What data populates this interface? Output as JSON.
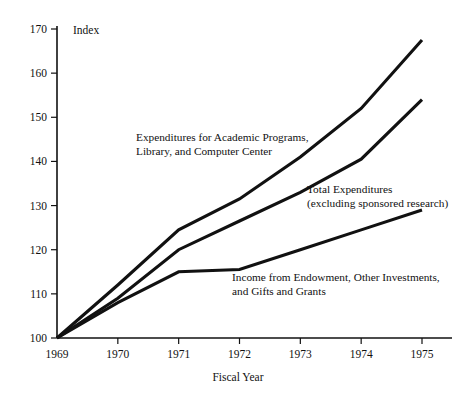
{
  "chart_data": {
    "type": "line",
    "title": "",
    "xlabel": "Fiscal Year",
    "ylabel": "Index",
    "x": [
      1969,
      1970,
      1971,
      1972,
      1973,
      1974,
      1975
    ],
    "xlim": [
      1969,
      1975
    ],
    "ylim": [
      100,
      170
    ],
    "yticks": [
      100,
      110,
      120,
      130,
      140,
      150,
      160,
      170
    ],
    "xticks": [
      1969,
      1970,
      1971,
      1972,
      1973,
      1974,
      1975
    ],
    "grid": false,
    "legend_position": "inline-annotations",
    "series": [
      {
        "name": "Expenditures for Academic Programs, Library, and Computer Center",
        "values": [
          100,
          112,
          124.5,
          131.5,
          141,
          152,
          167.5
        ]
      },
      {
        "name": "Total Expenditures (excluding sponsored research)",
        "values": [
          100,
          109,
          120,
          126.5,
          133,
          140.5,
          154
        ]
      },
      {
        "name": "Income from Endowment, Other Investments, and Gifts and Grants",
        "values": [
          100,
          108,
          115,
          115.5,
          120,
          124.5,
          129
        ]
      }
    ],
    "annotations": [
      {
        "id": "annot-0",
        "lines": [
          "Expenditures for Academic Programs,",
          "Library, and Computer Center"
        ]
      },
      {
        "id": "annot-1",
        "lines": [
          "Total Expenditures",
          "(excluding sponsored research)"
        ]
      },
      {
        "id": "annot-2",
        "lines": [
          "Income from Endowment, Other Investments,",
          "and Gifts and Grants"
        ]
      }
    ],
    "colors": {
      "line": "#111111",
      "axis": "#111111",
      "background": "#ffffff"
    }
  },
  "axis": {
    "y_title": "Index",
    "x_title": "Fiscal Year",
    "ytick_labels": [
      "100",
      "110",
      "120",
      "130",
      "140",
      "150",
      "160",
      "170"
    ],
    "xtick_labels": [
      "1969",
      "1970",
      "1971",
      "1972",
      "1973",
      "1974",
      "1975"
    ]
  },
  "annotations": {
    "a0l0": "Expenditures for Academic Programs,",
    "a0l1": "Library, and Computer Center",
    "a1l0": "Total Expenditures",
    "a1l1": "(excluding sponsored research)",
    "a2l0": "Income from Endowment, Other Investments,",
    "a2l1": "and Gifts and Grants"
  }
}
